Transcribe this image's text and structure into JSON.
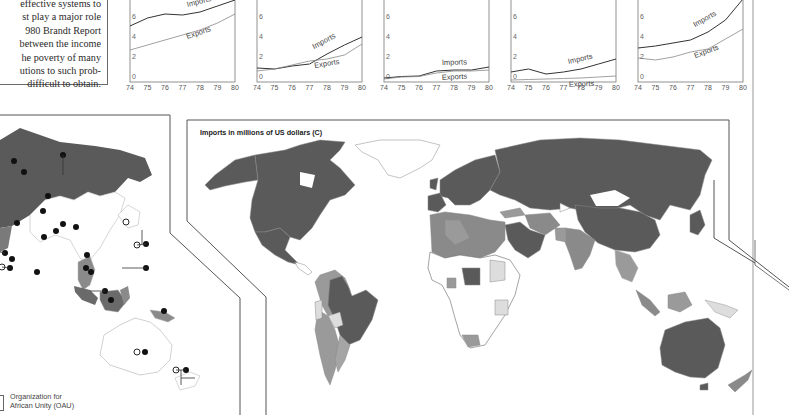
{
  "text_excerpt": {
    "lines": [
      "effective systems to",
      "st play a major role",
      "980 Brandt Report",
      "between the income",
      "he poverty of many",
      "utions to such prob-",
      "difficult to obtain."
    ]
  },
  "chart_data": [
    {
      "type": "line",
      "title": "",
      "x": [
        74,
        75,
        76,
        77,
        78,
        79,
        80
      ],
      "xlabel": "",
      "ylabel": "",
      "yticks": [
        0,
        2,
        4,
        6
      ],
      "ylim": [
        0,
        8
      ],
      "series": [
        {
          "name": "Imports",
          "values": [
            5.6,
            6.4,
            6.8,
            6.7,
            7.0,
            7.6,
            8.2
          ]
        },
        {
          "name": "Exports",
          "values": [
            3.2,
            3.7,
            4.2,
            4.7,
            5.2,
            5.9,
            6.8
          ]
        }
      ]
    },
    {
      "type": "line",
      "title": "",
      "x": [
        74,
        75,
        76,
        77,
        78,
        79,
        80
      ],
      "xlabel": "",
      "ylabel": "",
      "yticks": [
        0,
        2,
        4,
        6
      ],
      "ylim": [
        0,
        8
      ],
      "series": [
        {
          "name": "Imports",
          "values": [
            1.4,
            1.3,
            1.6,
            1.8,
            2.8,
            3.7,
            4.5
          ]
        },
        {
          "name": "Exports",
          "values": [
            1.1,
            1.3,
            1.7,
            2.1,
            2.3,
            2.7,
            3.8
          ]
        }
      ]
    },
    {
      "type": "line",
      "title": "",
      "x": [
        74,
        75,
        76,
        77,
        78,
        79,
        80
      ],
      "xlabel": "",
      "ylabel": "",
      "yticks": [
        0,
        2,
        4,
        6
      ],
      "ylim": [
        0,
        8
      ],
      "series": [
        {
          "name": "Imports",
          "values": [
            0.4,
            0.55,
            0.6,
            1.1,
            1.2,
            1.2,
            1.5
          ]
        },
        {
          "name": "Exports",
          "values": [
            0.3,
            0.5,
            0.55,
            0.9,
            1.1,
            1.1,
            1.2
          ]
        }
      ]
    },
    {
      "type": "line",
      "title": "",
      "x": [
        74,
        75,
        76,
        77,
        78,
        79,
        80
      ],
      "xlabel": "",
      "ylabel": "",
      "yticks": [
        0,
        2,
        4,
        6
      ],
      "ylim": [
        0,
        8
      ],
      "series": [
        {
          "name": "Imports",
          "values": [
            1.0,
            1.3,
            0.8,
            1.0,
            1.3,
            1.8,
            2.3
          ]
        },
        {
          "name": "Exports",
          "values": [
            0.2,
            0.25,
            0.3,
            0.35,
            0.4,
            0.5,
            0.6
          ]
        }
      ]
    },
    {
      "type": "line",
      "title": "",
      "x": [
        74,
        75,
        76,
        77,
        78,
        79,
        80
      ],
      "xlabel": "",
      "ylabel": "",
      "yticks": [
        0,
        2,
        4,
        6
      ],
      "ylim": [
        0,
        8
      ],
      "series": [
        {
          "name": "Imports",
          "values": [
            3.4,
            3.6,
            3.9,
            4.2,
            5.0,
            6.2,
            8.3
          ]
        },
        {
          "name": "Exports",
          "values": [
            2.4,
            2.2,
            2.5,
            3.0,
            3.3,
            4.3,
            5.3
          ]
        }
      ]
    }
  ],
  "charts_meta": [
    {
      "left": 123
    },
    {
      "left": 250
    },
    {
      "left": 377
    },
    {
      "left": 504
    },
    {
      "left": 631
    }
  ],
  "map": {
    "title": "Imports in millions of US dollars (C)",
    "colors": {
      "high": "#5a5a5a",
      "medium_high": "#7c7c7c",
      "medium": "#9a9a9a",
      "low": "#d8d8d8",
      "none": "#ffffff",
      "border": "#777777"
    }
  },
  "legend": {
    "line1": "Organization for",
    "line2": "African Unity (OAU)"
  }
}
